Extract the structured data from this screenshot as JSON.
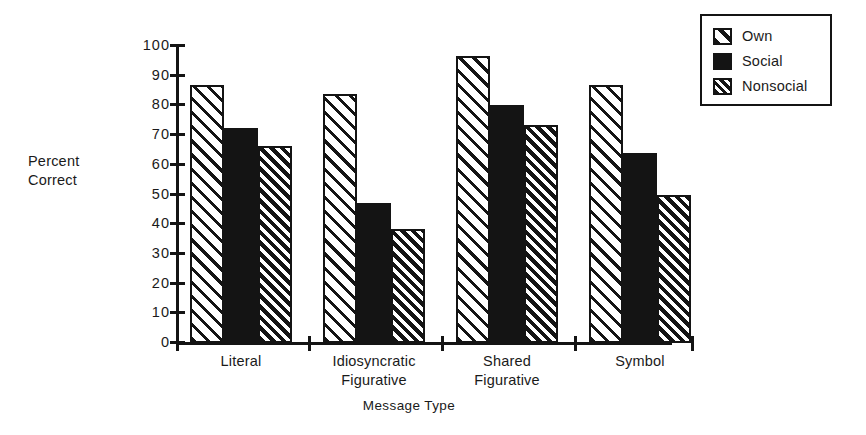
{
  "chart_data": {
    "type": "bar",
    "title": "",
    "xlabel": "Message Type",
    "ylabel": "Percent\nCorrect",
    "ylabel_lines": [
      "Percent",
      "Correct"
    ],
    "categories": [
      "Literal",
      "Idiosyncratic Figurative",
      "Shared Figurative",
      "Symbol"
    ],
    "category_lines": [
      [
        "Literal"
      ],
      [
        "Idiosyncratic",
        "Figurative"
      ],
      [
        "Shared",
        "Figurative"
      ],
      [
        "Symbol"
      ]
    ],
    "series": [
      {
        "name": "Own",
        "values": [
          87,
          84,
          96.5,
          87
        ],
        "fill": "diagonal-hatch-wide"
      },
      {
        "name": "Social",
        "values": [
          72.5,
          47,
          80,
          64
        ],
        "fill": "solid-black"
      },
      {
        "name": "Nonsocial",
        "values": [
          66.5,
          38.5,
          73.5,
          50
        ],
        "fill": "diagonal-hatch-dense"
      }
    ],
    "ylim": [
      0,
      100
    ],
    "ytick_values": [
      0,
      10,
      20,
      30,
      40,
      50,
      60,
      70,
      80,
      90,
      100
    ],
    "ytick_labels": [
      "0",
      "10",
      "20",
      "30",
      "40",
      "50",
      "60",
      "70",
      "80",
      "90",
      "100"
    ],
    "grid": false,
    "legend_position": "top-right",
    "colors": {
      "ink": "#141414",
      "background": "#ffffff"
    }
  },
  "legend": {
    "entries": [
      {
        "label": "Own",
        "swatch": "own"
      },
      {
        "label": "Social",
        "swatch": "social"
      },
      {
        "label": "Nonsocial",
        "swatch": "nonsocial"
      }
    ]
  }
}
